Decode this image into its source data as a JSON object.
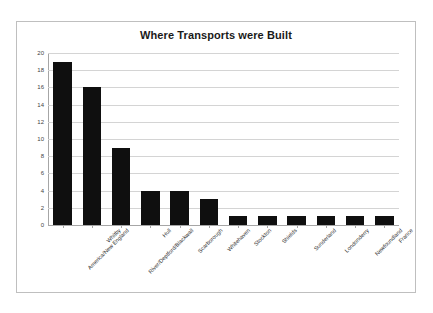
{
  "chart_data": {
    "type": "bar",
    "title": "Where Transports were Built",
    "xlabel": "",
    "ylabel": "",
    "ylim": [
      0,
      20
    ],
    "ytick_step": 2,
    "yticks": [
      20,
      18,
      16,
      14,
      12,
      10,
      8,
      6,
      4,
      2,
      0
    ],
    "grid": true,
    "legend": false,
    "bar_color": "#0f0f0f",
    "categories": [
      "America/New England",
      "Whitby",
      "River/Deptford/Blackwall",
      "Hull",
      "Scarborough",
      "Whitehaven",
      "Stockton",
      "Shields",
      "Sunderland",
      "Londonderry",
      "Newfoundland",
      "France"
    ],
    "values": [
      19,
      16,
      9,
      4,
      4,
      3,
      1,
      1,
      1,
      1,
      1,
      1
    ]
  },
  "colors": {
    "frame_border": "#bfbfbf",
    "gridline": "#d4d4d4",
    "axis": "#a6a6a6",
    "title_text": "#1a1a1a",
    "tick_text": "#3f3f3f"
  }
}
